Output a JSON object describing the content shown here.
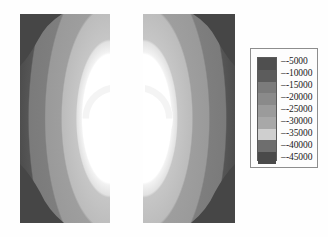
{
  "figure": {
    "type": "fea-contour-plot"
  },
  "legend": {
    "name": "contour-legend",
    "tick_mark": "–",
    "entries": [
      {
        "label": "-5000",
        "value": -5000,
        "color": "#4f4f4f"
      },
      {
        "label": "-10000",
        "value": -10000,
        "color": "#5c5c5c"
      },
      {
        "label": "-15000",
        "value": -15000,
        "color": "#7b7b7b"
      },
      {
        "label": "-20000",
        "value": -20000,
        "color": "#8a8a8a"
      },
      {
        "label": "-25000",
        "value": -25000,
        "color": "#9b9b9b"
      },
      {
        "label": "-30000",
        "value": -30000,
        "color": "#a8a8a8"
      },
      {
        "label": "-35000",
        "value": -35000,
        "color": "#cfcfcf"
      },
      {
        "label": "-40000",
        "value": -40000,
        "color": "#6e6e6e"
      },
      {
        "label": "-45000",
        "value": -45000,
        "color": "#4a4a4a"
      }
    ]
  },
  "chart_data": {
    "type": "heatmap",
    "title": "",
    "xlabel": "",
    "ylabel": "",
    "legend_position": "right",
    "grid": false,
    "colorbar_labels": [
      "-5000",
      "-10000",
      "-15000",
      "-20000",
      "-25000",
      "-30000",
      "-35000",
      "-40000",
      "-45000"
    ],
    "colorbar_values": [
      -5000,
      -10000,
      -15000,
      -20000,
      -25000,
      -30000,
      -35000,
      -40000,
      -45000
    ],
    "colorbar_colors": [
      "#4f4f4f",
      "#5c5c5c",
      "#7b7b7b",
      "#8a8a8a",
      "#9b9b9b",
      "#a8a8a8",
      "#cfcfcf",
      "#6e6e6e",
      "#4a4a4a"
    ],
    "panels": [
      {
        "name": "left-plate",
        "bands": [
          {
            "level": -5000,
            "color": "#4d4d4d"
          },
          {
            "level": -15000,
            "color": "#7d7d7d"
          },
          {
            "level": -25000,
            "color": "#9a9a9a"
          },
          {
            "level": -32000,
            "color": "#b9b9b9"
          },
          {
            "level": -40000,
            "color": "#dedede"
          },
          {
            "level": -45000,
            "color": "#f7f7f7"
          }
        ]
      },
      {
        "name": "right-plate",
        "bands": [
          {
            "level": -5000,
            "color": "#4d4d4d"
          },
          {
            "level": -15000,
            "color": "#7d7d7d"
          },
          {
            "level": -25000,
            "color": "#9a9a9a"
          },
          {
            "level": -32000,
            "color": "#b9b9b9"
          },
          {
            "level": -40000,
            "color": "#dedede"
          },
          {
            "level": -45000,
            "color": "#f7f7f7"
          }
        ]
      }
    ]
  }
}
